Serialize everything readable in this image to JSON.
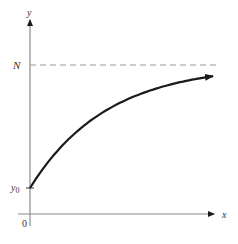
{
  "chart_data": {
    "type": "line",
    "title": "",
    "xlabel": "x",
    "ylabel": "y",
    "origin_label": "0",
    "series": [
      {
        "name": "y = N - (N - y0)e^(-kx)",
        "shape": "concave increasing curve starting at y0, approaching asymptote N",
        "x": [
          0,
          10,
          20,
          40,
          60,
          80,
          100,
          130,
          160,
          185
        ],
        "y": [
          0,
          0.12,
          0.23,
          0.41,
          0.54,
          0.65,
          0.73,
          0.82,
          0.88,
          0.91
        ],
        "value_note": "normalized: 0 = y0, 1 = N",
        "arrow_end": true
      }
    ],
    "reference_lines": [
      {
        "label": "N",
        "orientation": "horizontal",
        "style": "dashed",
        "meaning": "horizontal asymptote"
      }
    ],
    "y_tick_labels": [
      "y0",
      "N"
    ],
    "x_tick_labels": [
      "0"
    ],
    "grid": false,
    "legend": null
  },
  "labels": {
    "y_axis": "y",
    "x_axis": "x",
    "asymptote": "N",
    "initial": "y",
    "initial_sub": "0",
    "origin": "0"
  },
  "colors": {
    "axis": "#8a8a8a",
    "curve": "#1a1a1a",
    "dashed": "#9a9a9a",
    "text": "#333333"
  }
}
